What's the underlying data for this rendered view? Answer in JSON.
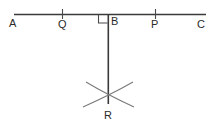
{
  "figure": {
    "canvas": {
      "width": 214,
      "height": 126,
      "background": "#ffffff"
    },
    "stroke_color": "#3a3a3a",
    "arc_color": "#6e6e6e",
    "labels": {
      "a": "A",
      "q": "Q",
      "b": "B",
      "p": "P",
      "c": "C",
      "r": "R"
    },
    "label_positions": {
      "a": {
        "x": 9,
        "y": 18
      },
      "q": {
        "x": 57,
        "y": 18
      },
      "b": {
        "x": 111,
        "y": 15
      },
      "p": {
        "x": 150,
        "y": 18
      },
      "c": {
        "x": 197,
        "y": 18
      }
    },
    "points": {
      "a": {
        "x": 15,
        "y": 14
      },
      "q": {
        "x": 62,
        "y": 14
      },
      "b": {
        "x": 108,
        "y": 14
      },
      "p": {
        "x": 155,
        "y": 14
      },
      "c": {
        "x": 205,
        "y": 14
      },
      "r": {
        "x": 108,
        "y": 103
      }
    },
    "right_angle_marker": {
      "x": 98,
      "y": 14,
      "size": 9
    },
    "tick_marks": [
      {
        "name": "tick-q",
        "x": 62,
        "y1": 9,
        "y2": 19
      },
      {
        "name": "tick-p",
        "x": 155,
        "y1": 9,
        "y2": 19
      }
    ]
  }
}
